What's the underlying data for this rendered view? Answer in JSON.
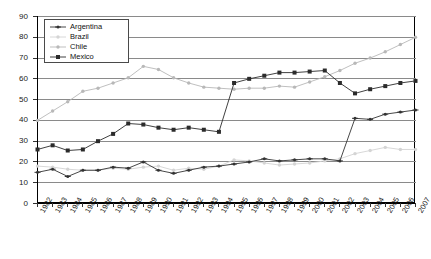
{
  "chart_data": {
    "type": "line",
    "title": "",
    "xlabel": "",
    "ylabel": "",
    "ylim": [
      0,
      90
    ],
    "ytick_step": 10,
    "yticks": [
      90,
      80,
      70,
      60,
      50,
      40,
      30,
      20,
      10,
      0
    ],
    "grid": true,
    "legend_position": "top-left",
    "categories": [
      "1982",
      "1983",
      "1984",
      "1985",
      "1986",
      "1987",
      "1988",
      "1989",
      "1990",
      "1991",
      "1992",
      "1993",
      "1994",
      "1995",
      "1996",
      "1997",
      "1998",
      "1999",
      "2000",
      "2001",
      "2002",
      "2003",
      "2004",
      "2005",
      "2006",
      "2007"
    ],
    "series": [
      {
        "name": "Argentina",
        "color": "#333333",
        "marker": "cross",
        "values": [
          15,
          16.5,
          13,
          16,
          16,
          17.5,
          17,
          20,
          16,
          14.5,
          16,
          17.5,
          18,
          19,
          20,
          21.5,
          20.5,
          21,
          21.5,
          21.5,
          20.5,
          41,
          40.5,
          43,
          44,
          45
        ]
      },
      {
        "name": "Brazil",
        "color": "#d4d4d4",
        "marker": "dot",
        "values": [
          18,
          17.5,
          16.5,
          16,
          16,
          17,
          16.5,
          17.5,
          18,
          16,
          17,
          16.5,
          18,
          21,
          20.5,
          19.5,
          18.5,
          19,
          19.5,
          20.5,
          21.5,
          24,
          25.5,
          27,
          26,
          26
        ]
      },
      {
        "name": "Chile",
        "color": "#b8b8b8",
        "marker": "dot",
        "values": [
          40,
          44.5,
          49,
          54,
          55.5,
          58,
          60.5,
          66,
          64.5,
          60.5,
          58,
          56,
          55.5,
          55,
          55.5,
          55.5,
          56.5,
          56,
          58.5,
          61,
          64,
          67.5,
          70,
          73,
          76.5,
          80
        ]
      },
      {
        "name": "Mexico",
        "color": "#2b2b2b",
        "marker": "square",
        "values": [
          26,
          28,
          25.5,
          26,
          30,
          33.5,
          38.5,
          38,
          36.5,
          35.5,
          36.5,
          35.5,
          34.5,
          58,
          60,
          61.5,
          63,
          63,
          63.5,
          64,
          58,
          53,
          55,
          56.5,
          58,
          59
        ]
      }
    ]
  }
}
